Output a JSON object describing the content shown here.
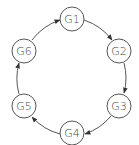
{
  "diagram": {
    "type": "directed-cycle",
    "colors": {
      "stroke": "#555555",
      "text": "#444444",
      "background": "#ffffff"
    },
    "nodes": [
      {
        "id": "G1",
        "label": "G1",
        "cx": 72,
        "cy": 19
      },
      {
        "id": "G2",
        "label": "G2",
        "cx": 119,
        "cy": 51
      },
      {
        "id": "G3",
        "label": "G3",
        "cx": 119,
        "cy": 106
      },
      {
        "id": "G4",
        "label": "G4",
        "cx": 72,
        "cy": 133
      },
      {
        "id": "G5",
        "label": "G5",
        "cx": 24,
        "cy": 106
      },
      {
        "id": "G6",
        "label": "G6",
        "cx": 24,
        "cy": 51
      }
    ],
    "edges": [
      {
        "from": "G1",
        "to": "G2"
      },
      {
        "from": "G2",
        "to": "G3"
      },
      {
        "from": "G3",
        "to": "G4"
      },
      {
        "from": "G4",
        "to": "G5"
      },
      {
        "from": "G5",
        "to": "G6"
      },
      {
        "from": "G6",
        "to": "G1"
      }
    ],
    "direction": "clockwise"
  }
}
